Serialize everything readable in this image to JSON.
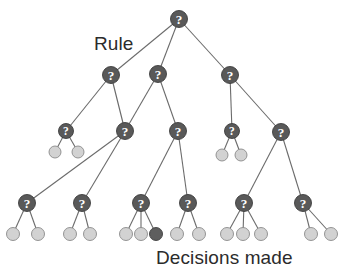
{
  "diagram": {
    "type": "tree",
    "labels": {
      "rule": "Rule",
      "decisions": "Decisions made"
    },
    "colors": {
      "rule_node_fill": "#595959",
      "rule_node_stroke": "#3d3d3d",
      "leaf_light_fill": "#d2d2d2",
      "leaf_light_stroke": "#8a8a8a",
      "leaf_dark_fill": "#5e5e5e",
      "edge": "#6b6b6b",
      "glyph": "#ffffff",
      "background": "#ffffff"
    },
    "node_glyph": "?",
    "nodes": [
      {
        "id": "n0",
        "kind": "rule",
        "cx": 179,
        "cy": 19,
        "r": 8.5,
        "depth": 0
      },
      {
        "id": "n1",
        "kind": "rule",
        "cx": 111,
        "cy": 75,
        "r": 8.5,
        "depth": 1
      },
      {
        "id": "n2",
        "kind": "rule",
        "cx": 158,
        "cy": 74,
        "r": 8.5,
        "depth": 1
      },
      {
        "id": "n3",
        "kind": "rule",
        "cx": 230,
        "cy": 75,
        "r": 8.5,
        "depth": 1
      },
      {
        "id": "n4",
        "kind": "rule",
        "cx": 66,
        "cy": 131,
        "r": 7.5,
        "depth": 2
      },
      {
        "id": "n5",
        "kind": "rule",
        "cx": 125,
        "cy": 131,
        "r": 8.5,
        "depth": 2
      },
      {
        "id": "n6",
        "kind": "rule",
        "cx": 178,
        "cy": 131,
        "r": 8.5,
        "depth": 2
      },
      {
        "id": "n7",
        "kind": "rule",
        "cx": 232,
        "cy": 131,
        "r": 7.5,
        "depth": 2
      },
      {
        "id": "n8",
        "kind": "rule",
        "cx": 281,
        "cy": 132,
        "r": 8.5,
        "depth": 2
      },
      {
        "id": "n9",
        "kind": "rule",
        "cx": 27,
        "cy": 203,
        "r": 8.5,
        "depth": 3
      },
      {
        "id": "n10",
        "kind": "rule",
        "cx": 82,
        "cy": 203,
        "r": 8.5,
        "depth": 3
      },
      {
        "id": "n11",
        "kind": "rule",
        "cx": 141,
        "cy": 203,
        "r": 8.5,
        "depth": 3
      },
      {
        "id": "n12",
        "kind": "rule",
        "cx": 188,
        "cy": 203,
        "r": 8.5,
        "depth": 3
      },
      {
        "id": "n13",
        "kind": "rule",
        "cx": 244,
        "cy": 203,
        "r": 8.5,
        "depth": 3
      },
      {
        "id": "n14",
        "kind": "rule",
        "cx": 303,
        "cy": 203,
        "r": 8.5,
        "depth": 3
      },
      {
        "id": "l1",
        "kind": "leaf-light",
        "cx": 55,
        "cy": 152,
        "r": 6,
        "depth": 3
      },
      {
        "id": "l2",
        "kind": "leaf-light",
        "cx": 78,
        "cy": 152,
        "r": 6,
        "depth": 3
      },
      {
        "id": "l3",
        "kind": "leaf-light",
        "cx": 222,
        "cy": 155,
        "r": 6,
        "depth": 3
      },
      {
        "id": "l4",
        "kind": "leaf-light",
        "cx": 241,
        "cy": 155,
        "r": 6,
        "depth": 3
      },
      {
        "id": "l5",
        "kind": "leaf-light",
        "cx": 13,
        "cy": 234,
        "r": 6.5,
        "depth": 4
      },
      {
        "id": "l6",
        "kind": "leaf-light",
        "cx": 38,
        "cy": 234,
        "r": 6.5,
        "depth": 4
      },
      {
        "id": "l7",
        "kind": "leaf-light",
        "cx": 70,
        "cy": 234,
        "r": 6.5,
        "depth": 4
      },
      {
        "id": "l8",
        "kind": "leaf-light",
        "cx": 90,
        "cy": 234,
        "r": 6.5,
        "depth": 4
      },
      {
        "id": "l9",
        "kind": "leaf-light",
        "cx": 126,
        "cy": 234,
        "r": 6.5,
        "depth": 4
      },
      {
        "id": "l10",
        "kind": "leaf-light",
        "cx": 141,
        "cy": 234,
        "r": 6.5,
        "depth": 4
      },
      {
        "id": "l11",
        "kind": "leaf-dark",
        "cx": 156,
        "cy": 234,
        "r": 6.5,
        "depth": 4
      },
      {
        "id": "l12",
        "kind": "leaf-light",
        "cx": 177,
        "cy": 234,
        "r": 6.5,
        "depth": 4
      },
      {
        "id": "l13",
        "kind": "leaf-light",
        "cx": 199,
        "cy": 234,
        "r": 6.5,
        "depth": 4
      },
      {
        "id": "l14",
        "kind": "leaf-light",
        "cx": 227,
        "cy": 234,
        "r": 6.5,
        "depth": 4
      },
      {
        "id": "l15",
        "kind": "leaf-light",
        "cx": 243,
        "cy": 234,
        "r": 6.5,
        "depth": 4
      },
      {
        "id": "l16",
        "kind": "leaf-light",
        "cx": 261,
        "cy": 234,
        "r": 6.5,
        "depth": 4
      },
      {
        "id": "l17",
        "kind": "leaf-light",
        "cx": 311,
        "cy": 234,
        "r": 6.5,
        "depth": 4
      },
      {
        "id": "l18",
        "kind": "leaf-light",
        "cx": 331,
        "cy": 234,
        "r": 6.5,
        "depth": 4
      }
    ],
    "edges": [
      {
        "from": "n0",
        "to": "n1"
      },
      {
        "from": "n0",
        "to": "n2"
      },
      {
        "from": "n0",
        "to": "n3"
      },
      {
        "from": "n1",
        "to": "n4"
      },
      {
        "from": "n1",
        "to": "n5"
      },
      {
        "from": "n2",
        "to": "n5"
      },
      {
        "from": "n2",
        "to": "n6"
      },
      {
        "from": "n3",
        "to": "n7"
      },
      {
        "from": "n3",
        "to": "n8"
      },
      {
        "from": "n4",
        "to": "l1"
      },
      {
        "from": "n4",
        "to": "l2"
      },
      {
        "from": "n5",
        "to": "n9"
      },
      {
        "from": "n5",
        "to": "n10"
      },
      {
        "from": "n6",
        "to": "n11"
      },
      {
        "from": "n6",
        "to": "n12"
      },
      {
        "from": "n7",
        "to": "l3"
      },
      {
        "from": "n7",
        "to": "l4"
      },
      {
        "from": "n8",
        "to": "n13"
      },
      {
        "from": "n8",
        "to": "n14"
      },
      {
        "from": "n9",
        "to": "l5"
      },
      {
        "from": "n9",
        "to": "l6"
      },
      {
        "from": "n10",
        "to": "l7"
      },
      {
        "from": "n10",
        "to": "l8"
      },
      {
        "from": "n11",
        "to": "l9"
      },
      {
        "from": "n11",
        "to": "l10"
      },
      {
        "from": "n11",
        "to": "l11"
      },
      {
        "from": "n12",
        "to": "l12"
      },
      {
        "from": "n12",
        "to": "l13"
      },
      {
        "from": "n13",
        "to": "l14"
      },
      {
        "from": "n13",
        "to": "l15"
      },
      {
        "from": "n13",
        "to": "l16"
      },
      {
        "from": "n14",
        "to": "l17"
      },
      {
        "from": "n14",
        "to": "l18"
      }
    ]
  }
}
